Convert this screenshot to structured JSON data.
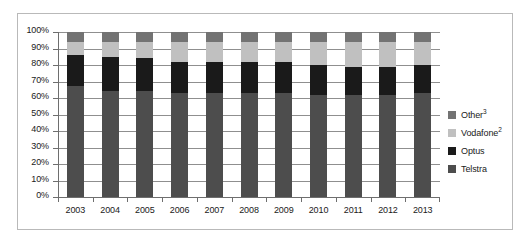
{
  "chart_data": {
    "type": "bar",
    "stacked": true,
    "stack_mode": "percent",
    "title": "",
    "subtitle": "",
    "xlabel": "",
    "ylabel": "",
    "categories": [
      "2003",
      "2004",
      "2005",
      "2006",
      "2007",
      "2008",
      "2009",
      "2010",
      "2011",
      "2012",
      "2013"
    ],
    "ylim": [
      0,
      100
    ],
    "ytick_labels": [
      "100%",
      "90%",
      "80%",
      "70%",
      "60%",
      "50%",
      "40%",
      "30%",
      "20%",
      "10%",
      "0%"
    ],
    "ytick_values": [
      100,
      90,
      80,
      70,
      60,
      50,
      40,
      30,
      20,
      10,
      0
    ],
    "grid": true,
    "grid_axis": "y",
    "legend_position": "right",
    "series": [
      {
        "name": "Telstra",
        "label": "Telstra",
        "color": "#4d4d4d",
        "values": [
          67,
          64,
          64,
          63,
          63,
          63,
          63,
          62,
          62,
          62,
          63
        ]
      },
      {
        "name": "Optus",
        "label": "Optus",
        "color": "#1a1a1a",
        "values": [
          19,
          21,
          20,
          19,
          19,
          19,
          19,
          18,
          17,
          17,
          17
        ]
      },
      {
        "name": "Vodafone",
        "label": "Vodafone",
        "superscript": "2",
        "color": "#c0c0c0",
        "values": [
          8,
          9,
          10,
          12,
          12,
          12,
          12,
          14,
          15,
          15,
          14
        ]
      },
      {
        "name": "Other",
        "label": "Other",
        "superscript": "3",
        "color": "#737373",
        "values": [
          6,
          6,
          6,
          6,
          6,
          6,
          6,
          6,
          6,
          6,
          6
        ]
      }
    ],
    "stack_order_bottom_to_top": [
      "Telstra",
      "Optus",
      "Vodafone",
      "Other"
    ],
    "legend_order_top_to_bottom": [
      "Other",
      "Vodafone",
      "Optus",
      "Telstra"
    ]
  },
  "style": {
    "frame_border_color": "#b9b9b9",
    "gridline_color": "#8f8f8f",
    "axis_color": "#6e6e6e",
    "text_color": "#1a1a1a",
    "background": "#ffffff"
  }
}
